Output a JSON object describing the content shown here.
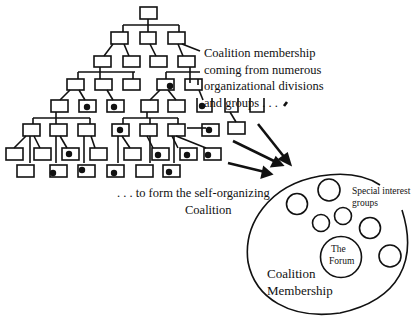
{
  "diagram": {
    "colors": {
      "stroke": "#111111",
      "background": "#ffffff"
    },
    "labels": {
      "source_caption": [
        "Coalition membership",
        "coming from numerous",
        "organizational divisions",
        "and groups . . ."
      ],
      "target_caption": [
        ". . . to form the self-organizing",
        "Coalition"
      ],
      "special_interest": [
        "Special interest",
        "groups"
      ],
      "forum": [
        "The",
        "Forum"
      ],
      "membership": [
        "Coalition",
        "Membership"
      ]
    },
    "org_chart": {
      "description": "Hierarchical organization chart of rectangular boxes; black dots mark members joining the coalition",
      "levels": 6
    },
    "coalition": {
      "outer_ellipse": "Coalition Membership",
      "inner_circles": {
        "special_interest_groups": 7,
        "forum": 1
      }
    },
    "arrows": {
      "count": 4,
      "direction": "org chart to coalition"
    }
  }
}
